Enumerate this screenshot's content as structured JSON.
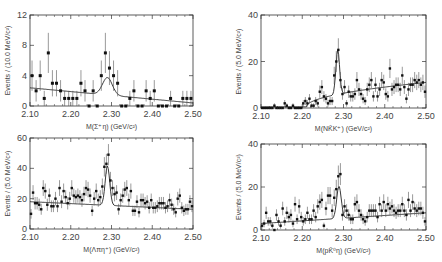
{
  "chart_data": [
    {
      "type": "scatter",
      "panel": "top-left",
      "xlabel": "M(Σ⁺η)  (GeV/c²)",
      "ylabel": "Events / (10.0 MeV/c²)",
      "xlim": [
        2.1,
        2.5
      ],
      "ylim": [
        0,
        12
      ],
      "xticks": [
        "2.10",
        "2.20",
        "2.30",
        "2.40",
        "2.50"
      ],
      "yticks": [
        "0",
        "4",
        "8",
        "12"
      ],
      "frame": {
        "x0": 30,
        "x1": 193,
        "y0": 15,
        "y1": 106
      },
      "bin_width": 0.01,
      "x": [
        2.105,
        2.115,
        2.125,
        2.135,
        2.145,
        2.155,
        2.165,
        2.175,
        2.185,
        2.195,
        2.205,
        2.215,
        2.225,
        2.235,
        2.245,
        2.255,
        2.265,
        2.275,
        2.285,
        2.295,
        2.305,
        2.315,
        2.325,
        2.335,
        2.345,
        2.355,
        2.365,
        2.375,
        2.385,
        2.395,
        2.405,
        2.415,
        2.425,
        2.435,
        2.445,
        2.455,
        2.465,
        2.475,
        2.485,
        2.495
      ],
      "values": [
        4,
        2,
        4,
        1,
        7,
        3,
        3,
        2,
        1,
        1,
        1,
        1,
        3,
        2,
        0,
        2,
        0,
        4,
        7,
        5,
        4,
        3,
        0,
        0,
        1,
        2,
        0,
        0,
        2,
        1,
        2,
        0,
        0,
        0,
        1,
        0,
        0,
        1,
        1,
        1
      ],
      "fit": {
        "bg_start": 2.4,
        "bg_end": 0.4,
        "peak_mean": 2.29,
        "peak_sigma": 0.012,
        "peak_amp": 2.3
      }
    },
    {
      "type": "scatter",
      "panel": "top-right",
      "xlabel": "M(NK̄K⁺)  (GeV/c²)",
      "ylabel": "Events / (5.0 MeV/c²)",
      "xlim": [
        2.1,
        2.5
      ],
      "ylim": [
        0,
        40
      ],
      "xticks": [
        "2.10",
        "2.20",
        "2.30",
        "2.40",
        "2.50"
      ],
      "yticks": [
        "0",
        "20",
        "40"
      ],
      "frame": {
        "x0": 261,
        "x1": 426,
        "y0": 15,
        "y1": 108
      },
      "bin_width": 0.005,
      "x": [
        2.1025,
        2.1075,
        2.1125,
        2.1175,
        2.1225,
        2.1275,
        2.1325,
        2.1375,
        2.1425,
        2.1475,
        2.1525,
        2.1575,
        2.1625,
        2.1675,
        2.1725,
        2.1775,
        2.1825,
        2.1875,
        2.1925,
        2.1975,
        2.2025,
        2.2075,
        2.2125,
        2.2175,
        2.2225,
        2.2275,
        2.2325,
        2.2375,
        2.2425,
        2.2475,
        2.2525,
        2.2575,
        2.2625,
        2.2675,
        2.2725,
        2.2775,
        2.2825,
        2.2875,
        2.2925,
        2.2975,
        2.3025,
        2.3075,
        2.3125,
        2.3175,
        2.3225,
        2.3275,
        2.3325,
        2.3375,
        2.3425,
        2.3475,
        2.3525,
        2.3575,
        2.3625,
        2.3675,
        2.3725,
        2.3775,
        2.3825,
        2.3875,
        2.3925,
        2.3975,
        2.4025,
        2.4075,
        2.4125,
        2.4175,
        2.4225,
        2.4275,
        2.4325,
        2.4375,
        2.4425,
        2.4475,
        2.4525,
        2.4575,
        2.4625,
        2.4675,
        2.4725,
        2.4775,
        2.4825,
        2.4875,
        2.4925,
        2.4975
      ],
      "values": [
        0,
        0,
        0,
        0,
        0,
        0,
        1,
        0,
        0,
        0,
        0,
        2,
        1,
        0,
        0,
        1,
        0,
        0,
        0,
        0,
        2,
        3,
        2,
        4,
        1,
        1,
        3,
        2,
        7,
        9,
        5,
        4,
        2,
        3,
        3,
        14,
        20,
        25,
        12,
        6,
        9,
        2,
        7,
        5,
        5,
        6,
        12,
        8,
        6,
        4,
        3,
        8,
        10,
        12,
        5,
        10,
        5,
        8,
        12,
        11,
        6,
        5,
        17,
        8,
        9,
        10,
        10,
        8,
        14,
        9,
        4,
        8,
        10,
        10,
        12,
        11,
        12,
        10,
        11,
        7
      ],
      "fit": {
        "bg_start": 0.5,
        "bg_end": 11,
        "threshold": 2.21,
        "peak_mean": 2.286,
        "peak_sigma": 0.0045,
        "peak_amp": 19
      }
    },
    {
      "type": "scatter",
      "panel": "bottom-left",
      "xlabel": "M(Λπη⁺)  (GeV/c²)",
      "ylabel": "Events / (5.0 MeV/c²)",
      "xlim": [
        2.1,
        2.5
      ],
      "ylim": [
        0,
        60
      ],
      "xticks": [
        "2.10",
        "2.20",
        "2.30",
        "2.40",
        "2.50"
      ],
      "yticks": [
        "0",
        "20",
        "40",
        "60"
      ],
      "frame": {
        "x0": 30,
        "x1": 193,
        "y0": 138,
        "y1": 229
      },
      "bin_width": 0.005,
      "x": [
        2.1025,
        2.1075,
        2.1125,
        2.1175,
        2.1225,
        2.1275,
        2.1325,
        2.1375,
        2.1425,
        2.1475,
        2.1525,
        2.1575,
        2.1625,
        2.1675,
        2.1725,
        2.1775,
        2.1825,
        2.1875,
        2.1925,
        2.1975,
        2.2025,
        2.2075,
        2.2125,
        2.2175,
        2.2225,
        2.2275,
        2.2325,
        2.2375,
        2.2425,
        2.2475,
        2.2525,
        2.2575,
        2.2625,
        2.2675,
        2.2725,
        2.2775,
        2.2825,
        2.2875,
        2.2925,
        2.2975,
        2.3025,
        2.3075,
        2.3125,
        2.3175,
        2.3225,
        2.3275,
        2.3325,
        2.3375,
        2.3425,
        2.3475,
        2.3525,
        2.3575,
        2.3625,
        2.3675,
        2.3725,
        2.3775,
        2.3825,
        2.3875,
        2.3925,
        2.3975,
        2.4025,
        2.4075,
        2.4125,
        2.4175,
        2.4225,
        2.4275,
        2.4325,
        2.4375,
        2.4425,
        2.4475,
        2.4525,
        2.4575,
        2.4625,
        2.4675,
        2.4725,
        2.4775,
        2.4825,
        2.4875,
        2.4925,
        2.4975
      ],
      "values": [
        10,
        24,
        17,
        17,
        16,
        13,
        27,
        25,
        16,
        22,
        15,
        15,
        20,
        15,
        27,
        18,
        25,
        21,
        17,
        20,
        27,
        22,
        21,
        22,
        21,
        19,
        23,
        27,
        26,
        22,
        12,
        20,
        25,
        19,
        21,
        28,
        41,
        43,
        49,
        32,
        27,
        23,
        24,
        13,
        19,
        22,
        26,
        27,
        19,
        25,
        12,
        12,
        18,
        11,
        19,
        19,
        17,
        18,
        14,
        19,
        14,
        14,
        15,
        17,
        17,
        17,
        14,
        15,
        19,
        16,
        13,
        11,
        20,
        22,
        14,
        12,
        13,
        13,
        18,
        15
      ],
      "fit": {
        "bg_start": 18,
        "bg_end": 13,
        "peak_mean": 2.29,
        "peak_sigma": 0.0055,
        "peak_amp": 26
      }
    },
    {
      "type": "scatter",
      "panel": "bottom-right",
      "xlabel": "M(pK̄⁰η) (GeV/c²)",
      "ylabel": "Events / (5.0 MeV/c²)",
      "xlim": [
        2.1,
        2.5
      ],
      "ylim": [
        0,
        40
      ],
      "xticks": [
        "2.10",
        "2.20",
        "2.30",
        "2.40",
        "2.50"
      ],
      "yticks": [
        "0",
        "20",
        "40"
      ],
      "frame": {
        "x0": 261,
        "x1": 426,
        "y0": 144,
        "y1": 230
      },
      "bin_width": 0.005,
      "x": [
        2.1025,
        2.1075,
        2.1125,
        2.1175,
        2.1225,
        2.1275,
        2.1325,
        2.1375,
        2.1425,
        2.1475,
        2.1525,
        2.1575,
        2.1625,
        2.1675,
        2.1725,
        2.1775,
        2.1825,
        2.1875,
        2.1925,
        2.1975,
        2.2025,
        2.2075,
        2.2125,
        2.2175,
        2.2225,
        2.2275,
        2.2325,
        2.2375,
        2.2425,
        2.2475,
        2.2525,
        2.2575,
        2.2625,
        2.2675,
        2.2725,
        2.2775,
        2.2825,
        2.2875,
        2.2925,
        2.2975,
        2.3025,
        2.3075,
        2.3125,
        2.3175,
        2.3225,
        2.3275,
        2.3325,
        2.3375,
        2.3425,
        2.3475,
        2.3525,
        2.3575,
        2.3625,
        2.3675,
        2.3725,
        2.3775,
        2.3825,
        2.3875,
        2.3925,
        2.3975,
        2.4025,
        2.4075,
        2.4125,
        2.4175,
        2.4225,
        2.4275,
        2.4325,
        2.4375,
        2.4425,
        2.4475,
        2.4525,
        2.4575,
        2.4625,
        2.4675,
        2.4725,
        2.4775,
        2.4825,
        2.4875,
        2.4925,
        2.4975
      ],
      "values": [
        2,
        3,
        8,
        4,
        4,
        2,
        0,
        7,
        4,
        2,
        10,
        4,
        8,
        6,
        7,
        3,
        12,
        5,
        11,
        6,
        4,
        5,
        8,
        5,
        5,
        9,
        6,
        11,
        13,
        14,
        2,
        10,
        16,
        16,
        9,
        15,
        19,
        25,
        26,
        7,
        11,
        9,
        7,
        5,
        5,
        12,
        13,
        9,
        7,
        5,
        4,
        6,
        9,
        9,
        9,
        9,
        6,
        12,
        9,
        13,
        9,
        12,
        10,
        11,
        9,
        8,
        9,
        9,
        12,
        9,
        7,
        14,
        9,
        13,
        10,
        9,
        10,
        10,
        8,
        4
      ],
      "fit": {
        "bg_start": 3,
        "bg_end": 8,
        "peak_mean": 2.289,
        "peak_sigma": 0.0055,
        "peak_amp": 15
      }
    }
  ]
}
